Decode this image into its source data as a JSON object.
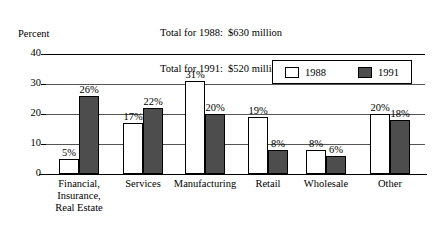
{
  "titles": {
    "total_1988": "Total for 1988:  $630 million",
    "total_1991": "Total for 1991:  $520 million",
    "axis_title": "Percent"
  },
  "legend": {
    "items": [
      {
        "label": "1988",
        "color": "#ffffff"
      },
      {
        "label": "1991",
        "color": "#4d4d4d"
      }
    ]
  },
  "axis": {
    "ticks": [
      "40",
      "30",
      "20",
      "10",
      "0"
    ]
  },
  "bar_labels": [
    [
      "5%",
      "26%"
    ],
    [
      "17%",
      "22%"
    ],
    [
      "31%",
      "20%"
    ],
    [
      "19%",
      "8%"
    ],
    [
      "8%",
      "6%"
    ],
    [
      "20%",
      "18%"
    ]
  ],
  "categories_display": [
    [
      "Financial,",
      "Insurance,",
      "Real Estate"
    ],
    [
      "Services"
    ],
    [
      "Manufacturing"
    ],
    [
      "Retail"
    ],
    [
      "Wholesale"
    ],
    [
      "Other"
    ]
  ],
  "chart_data": {
    "type": "bar",
    "xlabel": "",
    "ylabel": "Percent",
    "ylim": [
      0,
      40
    ],
    "yticks": [
      0,
      10,
      20,
      30,
      40
    ],
    "grid": true,
    "legend_position": "top-right",
    "categories": [
      "Financial, Insurance, Real Estate",
      "Services",
      "Manufacturing",
      "Retail",
      "Wholesale",
      "Other"
    ],
    "series": [
      {
        "name": "1988",
        "color": "#ffffff",
        "values": [
          5,
          17,
          31,
          19,
          8,
          20
        ]
      },
      {
        "name": "1991",
        "color": "#4d4d4d",
        "values": [
          26,
          22,
          20,
          8,
          6,
          18
        ]
      }
    ],
    "annotations": [
      "Total for 1988:  $630 million",
      "Total for 1991:  $520 million"
    ]
  }
}
